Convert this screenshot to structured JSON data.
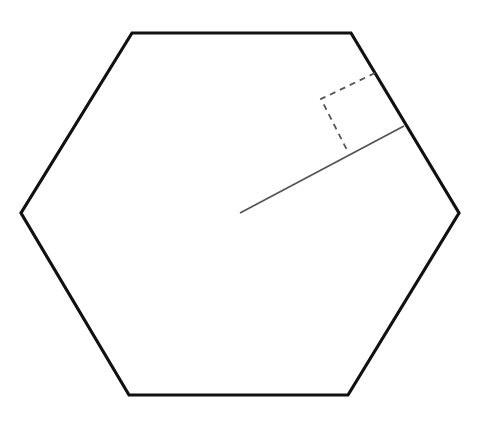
{
  "diagram": {
    "title": "",
    "shape": "regular-hexagon",
    "background": "#ffffff",
    "hexagon": {
      "points": [
        [
          132,
          33
        ],
        [
          351,
          33
        ],
        [
          459,
          213
        ],
        [
          348,
          395
        ],
        [
          129,
          395
        ],
        [
          21,
          213
        ]
      ],
      "stroke": "#111111",
      "stroke_width": 3.2
    },
    "apothem": {
      "from": [
        240,
        213
      ],
      "to": [
        404,
        126
      ],
      "stroke": "#555555",
      "stroke_width": 1.8
    },
    "right_angle_marker": {
      "points": [
        [
          375,
          73
        ],
        [
          321,
          99
        ],
        [
          348,
          152
        ]
      ],
      "stroke": "#555555",
      "stroke_width": 1.8,
      "dash": "6,5"
    },
    "labels": []
  }
}
